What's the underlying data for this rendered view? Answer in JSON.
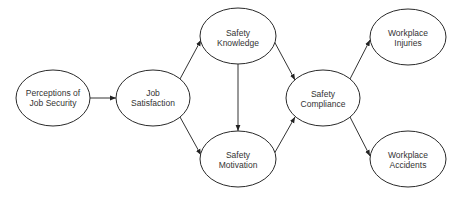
{
  "diagram": {
    "type": "path-model",
    "nodes": [
      {
        "id": "perceptions",
        "line1": "Perceptions of",
        "line2": "Job Security",
        "cx": 53,
        "cy": 98,
        "rx": 37,
        "ry": 28
      },
      {
        "id": "satisfaction",
        "line1": "Job",
        "line2": "Satisfaction",
        "cx": 153,
        "cy": 98,
        "rx": 37,
        "ry": 28
      },
      {
        "id": "knowledge",
        "line1": "Safety",
        "line2": "Knowledge",
        "cx": 238,
        "cy": 36,
        "rx": 38,
        "ry": 28
      },
      {
        "id": "motivation",
        "line1": "Safety",
        "line2": "Motivation",
        "cx": 238,
        "cy": 159,
        "rx": 38,
        "ry": 28
      },
      {
        "id": "compliance",
        "line1": "Safety",
        "line2": "Compliance",
        "cx": 323,
        "cy": 98,
        "rx": 37,
        "ry": 28
      },
      {
        "id": "injuries",
        "line1": "Workplace",
        "line2": "Injuries",
        "cx": 408,
        "cy": 37,
        "rx": 38,
        "ry": 28
      },
      {
        "id": "accidents",
        "line1": "Workplace",
        "line2": "Accidents",
        "cx": 408,
        "cy": 159,
        "rx": 38,
        "ry": 28
      }
    ],
    "edges": [
      {
        "from": "perceptions",
        "to": "satisfaction"
      },
      {
        "from": "satisfaction",
        "to": "knowledge"
      },
      {
        "from": "satisfaction",
        "to": "motivation"
      },
      {
        "from": "knowledge",
        "to": "motivation"
      },
      {
        "from": "knowledge",
        "to": "compliance"
      },
      {
        "from": "motivation",
        "to": "compliance"
      },
      {
        "from": "compliance",
        "to": "injuries"
      },
      {
        "from": "compliance",
        "to": "accidents"
      }
    ]
  }
}
